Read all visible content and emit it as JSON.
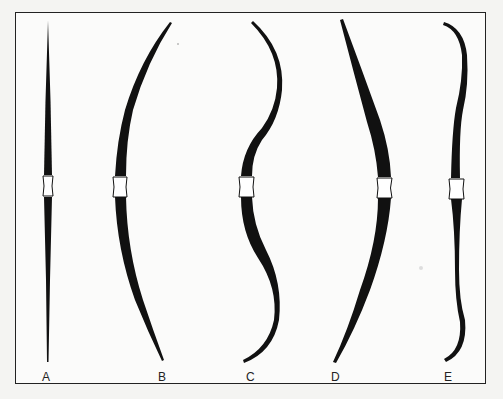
{
  "figure": {
    "border_color": "#222222",
    "ink_color": "#111111",
    "bows": [
      {
        "label": "A",
        "shape": "straight self bow"
      },
      {
        "label": "B",
        "shape": "simple curved (D-shaped) bow"
      },
      {
        "label": "C",
        "shape": "double-curved / recurved bow"
      },
      {
        "label": "D",
        "shape": "curved bow, reversed"
      },
      {
        "label": "E",
        "shape": "bow with reflexed tips"
      }
    ]
  }
}
